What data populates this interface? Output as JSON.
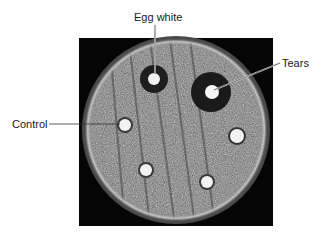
{
  "figure": {
    "labels": {
      "egg_white": "Egg white",
      "tears": "Tears",
      "control": "Control"
    },
    "colors": {
      "background": "#ffffff",
      "frame": "#050505",
      "agar": "#8a8a8a",
      "disc": "#f2f2f2",
      "halo": "#1e1e1e",
      "leader_line": "#333333"
    },
    "discs": [
      {
        "name": "egg-white-disc",
        "cx": 154,
        "cy": 79,
        "r": 6,
        "halo_r": 14
      },
      {
        "name": "tears-disc",
        "cx": 212,
        "cy": 92,
        "r": 7,
        "halo_r": 20
      },
      {
        "name": "control-disc",
        "cx": 125,
        "cy": 125,
        "r": 6,
        "halo_r": 8
      },
      {
        "name": "right-disc",
        "cx": 237,
        "cy": 136,
        "r": 7,
        "halo_r": 9
      },
      {
        "name": "bottom-left-disc",
        "cx": 146,
        "cy": 170,
        "r": 6,
        "halo_r": 8
      },
      {
        "name": "bottom-right-disc",
        "cx": 207,
        "cy": 182,
        "r": 6,
        "halo_r": 8
      }
    ]
  }
}
